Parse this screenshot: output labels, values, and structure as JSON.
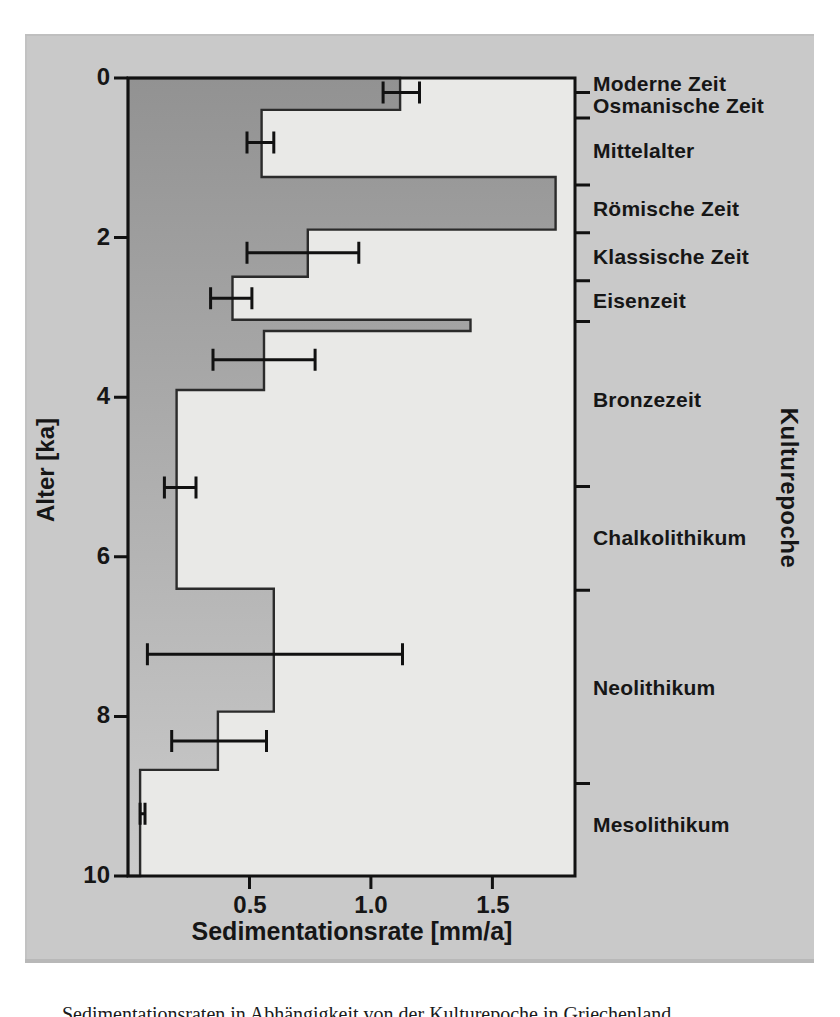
{
  "colors": {
    "panel_background": "#c9c9c9",
    "plot_background": "#e9e9e7",
    "area_fill_top": "#929292",
    "area_fill_bottom": "#cbcbcb",
    "line": "#161616"
  },
  "caption": {
    "fragment": "Sedimentationsraten in Abhängigkeit von der Kulturepoche in Griechenland"
  },
  "chart_data": {
    "type": "area",
    "variant": "horizontal-step-profile-with-error-bars",
    "title": "",
    "xlabel": "Sedimentationsrate [mm/a]",
    "ylabel": "Alter [ka]",
    "y2label": "Kulturepoche",
    "xlim": [
      0,
      1.84
    ],
    "ylim": [
      0,
      10
    ],
    "y_inverted": true,
    "grid": false,
    "x_ticks": [
      0.5,
      1.0,
      1.5
    ],
    "x_tick_labels": [
      "0.5",
      "1.0",
      "1.5"
    ],
    "y_ticks": [
      0,
      2,
      4,
      6,
      8,
      10
    ],
    "y_tick_labels": [
      "0",
      "2",
      "4",
      "6",
      "8",
      "10"
    ],
    "steps": [
      {
        "age_from_ka": 0.0,
        "age_to_ka": 0.4,
        "rate_mm_a": 1.12
      },
      {
        "age_from_ka": 0.4,
        "age_to_ka": 1.24,
        "rate_mm_a": 0.55
      },
      {
        "age_from_ka": 1.24,
        "age_to_ka": 1.9,
        "rate_mm_a": 1.76
      },
      {
        "age_from_ka": 1.9,
        "age_to_ka": 2.49,
        "rate_mm_a": 0.74
      },
      {
        "age_from_ka": 2.49,
        "age_to_ka": 3.03,
        "rate_mm_a": 0.43
      },
      {
        "age_from_ka": 3.03,
        "age_to_ka": 3.17,
        "rate_mm_a": 1.41
      },
      {
        "age_from_ka": 3.17,
        "age_to_ka": 3.91,
        "rate_mm_a": 0.56
      },
      {
        "age_from_ka": 3.91,
        "age_to_ka": 6.4,
        "rate_mm_a": 0.2
      },
      {
        "age_from_ka": 6.4,
        "age_to_ka": 7.94,
        "rate_mm_a": 0.6
      },
      {
        "age_from_ka": 7.94,
        "age_to_ka": 8.67,
        "rate_mm_a": 0.37
      },
      {
        "age_from_ka": 8.67,
        "age_to_ka": 10.0,
        "rate_mm_a": 0.05
      }
    ],
    "error_bars": [
      {
        "age_ka": 0.18,
        "rate_min": 1.05,
        "rate_max": 1.2
      },
      {
        "age_ka": 0.81,
        "rate_min": 0.49,
        "rate_max": 0.6
      },
      {
        "age_ka": 2.19,
        "rate_min": 0.49,
        "rate_max": 0.95
      },
      {
        "age_ka": 2.76,
        "rate_min": 0.34,
        "rate_max": 0.51
      },
      {
        "age_ka": 3.53,
        "rate_min": 0.35,
        "rate_max": 0.77
      },
      {
        "age_ka": 5.13,
        "rate_min": 0.15,
        "rate_max": 0.28
      },
      {
        "age_ka": 7.22,
        "rate_min": 0.08,
        "rate_max": 1.13
      },
      {
        "age_ka": 8.31,
        "rate_min": 0.18,
        "rate_max": 0.57
      },
      {
        "age_ka": 9.22,
        "rate_min": 0.05,
        "rate_max": 0.07
      }
    ],
    "epochs": [
      {
        "label": "Moderne Zeit",
        "age_from_ka": 0.0,
        "age_to_ka": 0.18
      },
      {
        "label": "Osmanische Zeit",
        "age_from_ka": 0.18,
        "age_to_ka": 0.5
      },
      {
        "label": "Mittelalter",
        "age_from_ka": 0.5,
        "age_to_ka": 1.34
      },
      {
        "label": "Römische Zeit",
        "age_from_ka": 1.34,
        "age_to_ka": 1.94
      },
      {
        "label": "Klassische Zeit",
        "age_from_ka": 1.94,
        "age_to_ka": 2.54
      },
      {
        "label": "Eisenzeit",
        "age_from_ka": 2.54,
        "age_to_ka": 3.05
      },
      {
        "label": "Bronzezeit",
        "age_from_ka": 3.05,
        "age_to_ka": 5.12
      },
      {
        "label": "Chalkolithikum",
        "age_from_ka": 5.12,
        "age_to_ka": 6.42
      },
      {
        "label": "Neolithikum",
        "age_from_ka": 6.42,
        "age_to_ka": 8.84
      },
      {
        "label": "Mesolithikum",
        "age_from_ka": 8.84,
        "age_to_ka": 10.0
      }
    ]
  }
}
